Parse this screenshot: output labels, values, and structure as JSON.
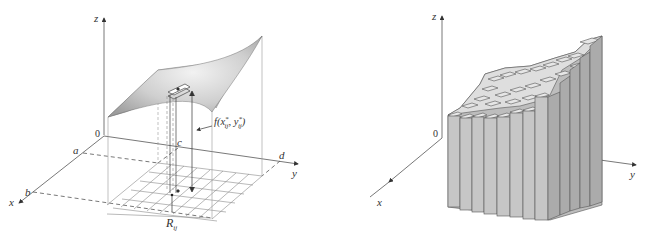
{
  "left_figure": {
    "description": "Surface z = f(x,y) over rectangle R = [a,b] x [c,d] with sample box R_ij",
    "axis_labels": {
      "z": "z",
      "y": "y",
      "x": "x",
      "origin": "0"
    },
    "bound_labels": {
      "a": "a",
      "b": "b",
      "c": "c",
      "d": "d"
    },
    "height_label": "f(x*ij, y*ij)",
    "height_label_parts": {
      "f": "f(x",
      "sup1": "*",
      "sub1": "ij",
      "mid": ", y",
      "sup2": "*",
      "sub2": "ij",
      "end": ")"
    },
    "subrect_label": {
      "main": "R",
      "sub": "ij"
    },
    "grid_divisions": {
      "m": 8,
      "n": 6
    },
    "colors": {
      "surface": "#b8b8b8",
      "axis": "#555555",
      "grid": "#888888"
    }
  },
  "right_figure": {
    "description": "Approximation of volume by rectangular boxes (Riemann sum columns)",
    "axis_labels": {
      "z": "z",
      "y": "y",
      "x": "x",
      "origin": "0"
    },
    "colors": {
      "box_front": "#c4c4c4",
      "box_side": "#a9a9a9",
      "box_top": "#e4e4e4",
      "edge": "#555555"
    }
  }
}
